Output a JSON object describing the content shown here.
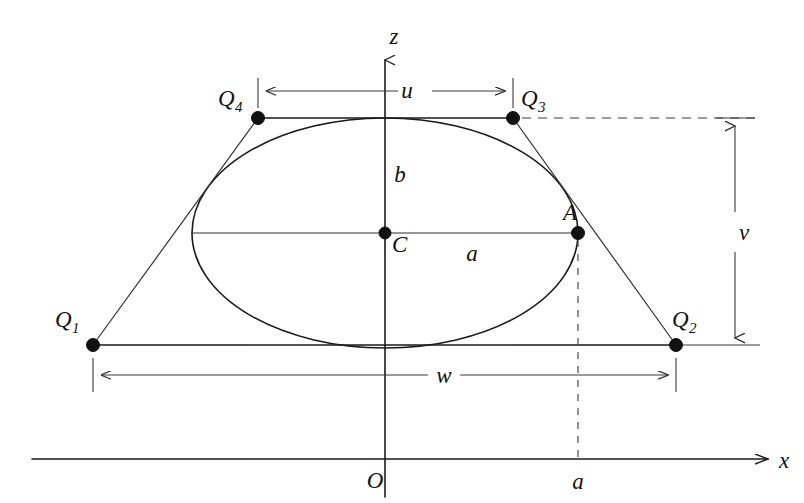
{
  "figure": {
    "kind": "geometry-diagram",
    "background_color": "#ffffff",
    "line_color": "#1a1a1a"
  },
  "axes": {
    "x_axis": {
      "label": "x",
      "y_pixel": 459,
      "x_start": 32,
      "x_end": 772,
      "arrow": "right"
    },
    "z_axis": {
      "label": "z",
      "x_pixel": 385,
      "y_start": 495,
      "y_end": 54,
      "arrow": "up"
    },
    "origin": {
      "label": "O",
      "x": 385,
      "y": 459
    }
  },
  "points": [
    {
      "name": "Q1",
      "label": "Q",
      "subscript": "1",
      "x": 93,
      "y": 345
    },
    {
      "name": "Q2",
      "label": "Q",
      "subscript": "2",
      "x": 676,
      "y": 345
    },
    {
      "name": "Q3",
      "label": "Q",
      "subscript": "3",
      "x": 513,
      "y": 118
    },
    {
      "name": "Q4",
      "label": "Q",
      "subscript": "4",
      "x": 258,
      "y": 118
    },
    {
      "name": "C",
      "label": "C",
      "subscript": "",
      "x": 385,
      "y": 233
    },
    {
      "name": "A",
      "label": "A",
      "subscript": "",
      "x": 578,
      "y": 233
    }
  ],
  "ellipse": {
    "center_x": 385,
    "center_y": 233,
    "semi_major_a": 193,
    "semi_minor_b": 115
  },
  "dimensions": [
    {
      "name": "u",
      "label": "u",
      "orientation": "horizontal",
      "from": 258,
      "to": 513,
      "at": 91,
      "label_x": 415,
      "label_y": 88
    },
    {
      "name": "w",
      "label": "w",
      "orientation": "horizontal",
      "from": 93,
      "to": 676,
      "at": 375,
      "label_x": 443,
      "label_y": 372
    },
    {
      "name": "v",
      "label": "v",
      "orientation": "vertical",
      "from": 120,
      "to": 344,
      "at": 735,
      "label_x": 744,
      "label_y": 238
    }
  ],
  "segment_labels": [
    {
      "name": "semi-minor-label",
      "label": "b",
      "x": 400,
      "y": 180
    },
    {
      "name": "semi-major-label",
      "label": "a",
      "x": 470,
      "y": 258
    },
    {
      "name": "x-axis-tick-label",
      "label": "a",
      "x": 578,
      "y": 486
    }
  ],
  "axis_tick_labels": {
    "origin": "O",
    "a_on_x": "a"
  }
}
